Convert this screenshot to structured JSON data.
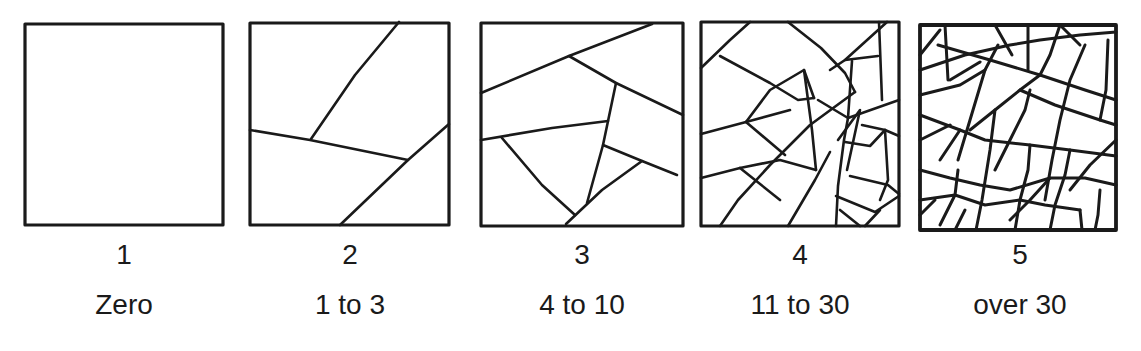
{
  "figure": {
    "panels": [
      {
        "number": "1",
        "label": "Zero"
      },
      {
        "number": "2",
        "label": "1 to 3"
      },
      {
        "number": "3",
        "label": "4 to 10"
      },
      {
        "number": "4",
        "label": "11 to 30"
      },
      {
        "number": "5",
        "label": "over 30"
      }
    ]
  }
}
